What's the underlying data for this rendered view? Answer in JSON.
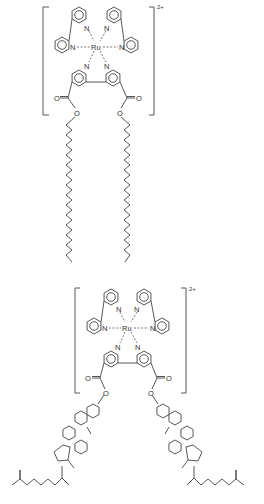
{
  "figure": {
    "structures": [
      {
        "id": "ru-bipy-alkyl-ester",
        "metal": "Ru",
        "charge": "2+",
        "ligands": [
          "bipyridine",
          "bipyridine",
          "4,4'-bis(alkyl ester)-bipyridine"
        ],
        "atom_labels": [
          "N",
          "N",
          "N",
          "N",
          "N",
          "N",
          "Ru",
          "O",
          "O",
          "O",
          "O"
        ],
        "tail": "long alkyl chain"
      },
      {
        "id": "ru-bipy-cholesteryl-ester",
        "metal": "Ru",
        "charge": "2+",
        "ligands": [
          "bipyridine",
          "bipyridine",
          "4,4'-bis(cholesteryl ester)-bipyridine"
        ],
        "atom_labels": [
          "N",
          "N",
          "N",
          "N",
          "N",
          "N",
          "Ru",
          "O",
          "O",
          "O",
          "O"
        ],
        "tail": "cholesteryl"
      }
    ],
    "labels": {
      "metal": "Ru",
      "nitrogen": "N",
      "oxygen": "O",
      "charge": "2+"
    }
  }
}
